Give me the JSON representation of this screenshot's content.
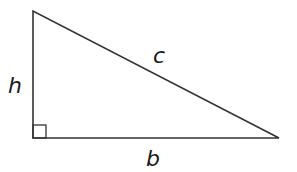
{
  "diagram": {
    "type": "right-triangle",
    "labels": {
      "height": "h",
      "hypotenuse": "c",
      "base": "b"
    },
    "colors": {
      "stroke": "#333333",
      "text": "#1a1a1a",
      "background": "#ffffff"
    }
  }
}
